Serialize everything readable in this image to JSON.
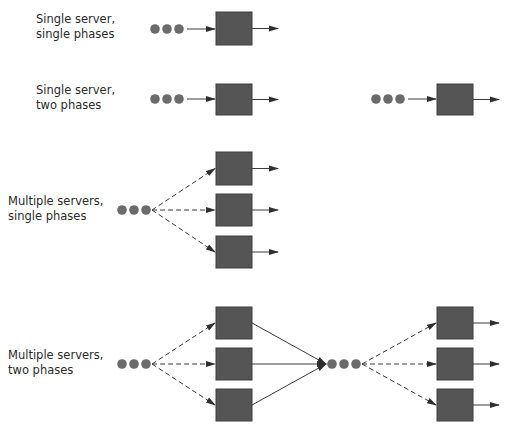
{
  "diagram": {
    "colors": {
      "server": "#555555",
      "server_border": "#3f3f3f",
      "customer": "#6b6b6b",
      "line": "#3a3a3a",
      "text": "#2a2a2a"
    },
    "rows": [
      {
        "id": "single-server-single-phase",
        "label_line1": "Single server,",
        "label_line2": "single phases",
        "label_pos": [
          36,
          12
        ],
        "queues": [
          {
            "x": 155,
            "y": 29
          }
        ],
        "servers": [
          {
            "x": 216,
            "y": 12,
            "w": 36,
            "h": 33
          }
        ]
      },
      {
        "id": "single-server-two-phases",
        "label_line1": "Single server,",
        "label_line2": "two phases",
        "label_pos": [
          36,
          83
        ],
        "queues": [
          {
            "x": 155,
            "y": 99
          },
          {
            "x": 376,
            "y": 99
          }
        ],
        "servers": [
          {
            "x": 216,
            "y": 84,
            "w": 36,
            "h": 31
          },
          {
            "x": 437,
            "y": 84,
            "w": 36,
            "h": 31
          }
        ]
      },
      {
        "id": "multiple-servers-single-phase",
        "label_line1": "Multiple servers,",
        "label_line2": "single phases",
        "label_pos": [
          8,
          194
        ],
        "queues": [
          {
            "x": 122,
            "y": 210
          }
        ],
        "servers": [
          {
            "x": 216,
            "y": 152,
            "w": 36,
            "h": 33
          },
          {
            "x": 216,
            "y": 194,
            "w": 36,
            "h": 32
          },
          {
            "x": 216,
            "y": 236,
            "w": 36,
            "h": 32
          }
        ]
      },
      {
        "id": "multiple-servers-two-phases",
        "label_line1": "Multiple servers,",
        "label_line2": "two phases",
        "label_pos": [
          8,
          348
        ],
        "queues": [
          {
            "x": 122,
            "y": 364
          },
          {
            "x": 332,
            "y": 364
          }
        ],
        "servers": [
          {
            "x": 216,
            "y": 307,
            "w": 36,
            "h": 32
          },
          {
            "x": 216,
            "y": 348,
            "w": 36,
            "h": 32
          },
          {
            "x": 216,
            "y": 389,
            "w": 36,
            "h": 32
          },
          {
            "x": 437,
            "y": 307,
            "w": 36,
            "h": 32
          },
          {
            "x": 437,
            "y": 348,
            "w": 36,
            "h": 32
          },
          {
            "x": 437,
            "y": 389,
            "w": 36,
            "h": 32
          }
        ]
      }
    ]
  }
}
